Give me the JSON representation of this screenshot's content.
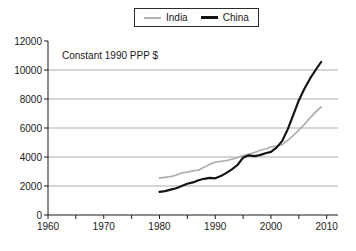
{
  "chart_data": {
    "type": "line",
    "title": "",
    "annotation": "Constant 1990 PPP $",
    "xlabel": "",
    "ylabel": "",
    "x": [
      1980,
      1981,
      1982,
      1983,
      1984,
      1985,
      1986,
      1987,
      1988,
      1989,
      1990,
      1991,
      1992,
      1993,
      1994,
      1995,
      1996,
      1997,
      1998,
      1999,
      2000,
      2001,
      2002,
      2003,
      2004,
      2005,
      2006,
      2007,
      2008,
      2009
    ],
    "series": [
      {
        "name": "India",
        "color": "#b2b2b2",
        "stroke_width": 1.8,
        "values": [
          2550,
          2600,
          2650,
          2750,
          2900,
          2950,
          3050,
          3100,
          3300,
          3500,
          3650,
          3700,
          3750,
          3850,
          3950,
          4100,
          4200,
          4300,
          4450,
          4550,
          4700,
          4750,
          4850,
          5150,
          5500,
          5850,
          6250,
          6700,
          7100,
          7450
        ]
      },
      {
        "name": "China",
        "color": "#141414",
        "stroke_width": 2.2,
        "values": [
          1600,
          1650,
          1750,
          1850,
          2000,
          2150,
          2250,
          2400,
          2500,
          2560,
          2530,
          2680,
          2900,
          3150,
          3450,
          3950,
          4120,
          4060,
          4130,
          4260,
          4350,
          4650,
          5100,
          5900,
          6900,
          7900,
          8700,
          9400,
          10000,
          10550
        ]
      }
    ],
    "x_axis": {
      "min": 1960,
      "max": 2010,
      "tick_step": 5,
      "label_step": 10,
      "tick_labels": [
        "1960",
        "1970",
        "1980",
        "1990",
        "2000",
        "2010"
      ]
    },
    "y_axis": {
      "min": 0,
      "max": 12000,
      "tick_step": 2000,
      "tick_labels": [
        "0",
        "2000",
        "4000",
        "6000",
        "8000",
        "10000",
        "12000"
      ]
    },
    "xlim": [
      1960,
      2010
    ],
    "ylim": [
      0,
      12000
    ],
    "grid": true,
    "gridline_values": [
      2000,
      4000,
      6000,
      8000,
      10000
    ],
    "legend_position": "top-center",
    "colors": {
      "grid": "#ababab",
      "axis": "#1a1a1a",
      "text": "#1a1a1a",
      "background": "#ffffff",
      "legend_border": "#2b2b2b"
    }
  }
}
